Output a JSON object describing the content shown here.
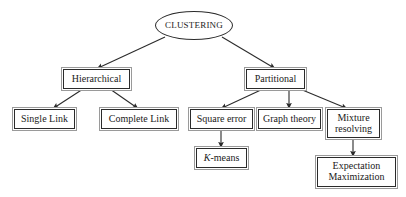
{
  "diagram": {
    "type": "tree-hierarchy",
    "background_color": "#ffffff",
    "stroke_color": "#2b2b2b",
    "text_color": "#1a1a1a",
    "nodes": {
      "root": {
        "label": "CLUSTERING",
        "shape": "ellipse"
      },
      "hierarchical": {
        "label": "Hierarchical",
        "shape": "rect"
      },
      "partitional": {
        "label": "Partitional",
        "shape": "rect"
      },
      "single_link": {
        "label": "Single Link",
        "shape": "rect"
      },
      "complete_link": {
        "label": "Complete Link",
        "shape": "rect"
      },
      "square_error": {
        "label": "Square error",
        "shape": "rect"
      },
      "graph_theory": {
        "label": "Graph theory",
        "shape": "rect"
      },
      "mixture_resolving": {
        "label": "Mixture\nresolving",
        "shape": "rect"
      },
      "k_means": {
        "label_prefix": "K",
        "label_suffix": "-means",
        "shape": "rect"
      },
      "expectation_maximization": {
        "label": "Expectation\nMaximization",
        "shape": "rect"
      }
    },
    "edges": [
      {
        "from": "root",
        "to": "hierarchical",
        "arrow": true
      },
      {
        "from": "root",
        "to": "partitional",
        "arrow": true
      },
      {
        "from": "hierarchical",
        "to": "single_link",
        "arrow": true
      },
      {
        "from": "hierarchical",
        "to": "complete_link",
        "arrow": true
      },
      {
        "from": "partitional",
        "to": "square_error",
        "arrow": true
      },
      {
        "from": "partitional",
        "to": "graph_theory",
        "arrow": true
      },
      {
        "from": "partitional",
        "to": "mixture_resolving",
        "arrow": true
      },
      {
        "from": "square_error",
        "to": "k_means",
        "arrow": true
      },
      {
        "from": "mixture_resolving",
        "to": "expectation_maximization",
        "arrow": true
      }
    ]
  }
}
